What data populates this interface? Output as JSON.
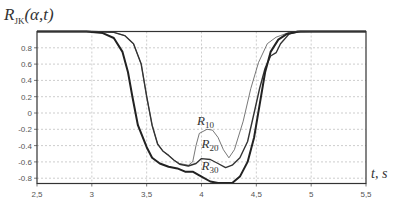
{
  "chart_data": {
    "type": "line",
    "title_main": "R",
    "title_sub": "JK",
    "title_args": "(α,t)",
    "xlabel": "t, s",
    "ylabel": "R_JK(α,t)",
    "xlim": [
      2.5,
      5.5
    ],
    "ylim": [
      -0.86,
      1.0
    ],
    "grid": true,
    "x_ticks": [
      2.5,
      3,
      3.5,
      4,
      4.5,
      5,
      5.5
    ],
    "x_tick_labels": [
      "2,5",
      "3",
      "3,5",
      "4",
      "4,5",
      "5",
      "5,5"
    ],
    "y_ticks": [
      0.8,
      0.6,
      0.4,
      0.2,
      0,
      -0.2,
      -0.4,
      -0.6,
      -0.8
    ],
    "y_tick_labels": [
      "0.8",
      "0.6",
      "0.4",
      "0.2",
      "0",
      "-0.2",
      "-0.4",
      "-0.6",
      "-0.8"
    ],
    "series": [
      {
        "name": "R10",
        "label_main": "R",
        "label_sub": "10",
        "label_pos": [
          3.96,
          -0.15
        ],
        "stroke_width": 0.8,
        "color": "#555555",
        "points": [
          [
            2.5,
            1.0
          ],
          [
            3.0,
            1.0
          ],
          [
            3.2,
            0.99
          ],
          [
            3.3,
            0.95
          ],
          [
            3.38,
            0.85
          ],
          [
            3.45,
            0.6
          ],
          [
            3.5,
            0.2
          ],
          [
            3.55,
            -0.15
          ],
          [
            3.6,
            -0.38
          ],
          [
            3.65,
            -0.47
          ],
          [
            3.7,
            -0.52
          ],
          [
            3.75,
            -0.58
          ],
          [
            3.8,
            -0.62
          ],
          [
            3.88,
            -0.64
          ],
          [
            3.92,
            -0.6
          ],
          [
            3.95,
            -0.4
          ],
          [
            3.98,
            -0.25
          ],
          [
            4.05,
            -0.2
          ],
          [
            4.1,
            -0.21
          ],
          [
            4.15,
            -0.3
          ],
          [
            4.2,
            -0.45
          ],
          [
            4.25,
            -0.55
          ],
          [
            4.3,
            -0.45
          ],
          [
            4.38,
            -0.1
          ],
          [
            4.45,
            0.3
          ],
          [
            4.52,
            0.62
          ],
          [
            4.6,
            0.85
          ],
          [
            4.68,
            0.93
          ],
          [
            4.72,
            0.95
          ],
          [
            4.8,
            0.99
          ],
          [
            5.0,
            1.0
          ],
          [
            5.5,
            1.0
          ]
        ]
      },
      {
        "name": "R20",
        "label_main": "R",
        "label_sub": "20",
        "label_pos": [
          4.0,
          -0.43
        ],
        "stroke_width": 1.4,
        "color": "#333333",
        "points": [
          [
            2.5,
            1.0
          ],
          [
            3.0,
            1.0
          ],
          [
            3.2,
            0.99
          ],
          [
            3.3,
            0.95
          ],
          [
            3.38,
            0.85
          ],
          [
            3.45,
            0.6
          ],
          [
            3.5,
            0.2
          ],
          [
            3.55,
            -0.15
          ],
          [
            3.6,
            -0.38
          ],
          [
            3.65,
            -0.47
          ],
          [
            3.7,
            -0.52
          ],
          [
            3.75,
            -0.58
          ],
          [
            3.8,
            -0.63
          ],
          [
            3.88,
            -0.65
          ],
          [
            3.95,
            -0.62
          ],
          [
            4.0,
            -0.56
          ],
          [
            4.08,
            -0.57
          ],
          [
            4.15,
            -0.62
          ],
          [
            4.22,
            -0.67
          ],
          [
            4.28,
            -0.64
          ],
          [
            4.35,
            -0.55
          ],
          [
            4.42,
            -0.35
          ],
          [
            4.48,
            0.0
          ],
          [
            4.53,
            0.3
          ],
          [
            4.58,
            0.55
          ],
          [
            4.63,
            0.7
          ],
          [
            4.68,
            0.74
          ],
          [
            4.72,
            0.85
          ],
          [
            4.8,
            0.97
          ],
          [
            4.9,
            1.0
          ],
          [
            5.5,
            1.0
          ]
        ]
      },
      {
        "name": "R30",
        "label_main": "R",
        "label_sub": "30",
        "label_pos": [
          4.0,
          -0.7
        ],
        "stroke_width": 2.0,
        "color": "#222222",
        "points": [
          [
            2.5,
            1.0
          ],
          [
            2.95,
            1.0
          ],
          [
            3.1,
            0.98
          ],
          [
            3.2,
            0.92
          ],
          [
            3.28,
            0.75
          ],
          [
            3.33,
            0.5
          ],
          [
            3.37,
            0.2
          ],
          [
            3.42,
            -0.15
          ],
          [
            3.5,
            -0.42
          ],
          [
            3.55,
            -0.55
          ],
          [
            3.62,
            -0.62
          ],
          [
            3.7,
            -0.66
          ],
          [
            3.78,
            -0.68
          ],
          [
            3.85,
            -0.72
          ],
          [
            3.92,
            -0.72
          ],
          [
            4.0,
            -0.78
          ],
          [
            4.08,
            -0.84
          ],
          [
            4.15,
            -0.86
          ],
          [
            4.28,
            -0.86
          ],
          [
            4.35,
            -0.78
          ],
          [
            4.42,
            -0.6
          ],
          [
            4.48,
            -0.3
          ],
          [
            4.53,
            0.1
          ],
          [
            4.58,
            0.5
          ],
          [
            4.63,
            0.75
          ],
          [
            4.7,
            0.9
          ],
          [
            4.78,
            0.97
          ],
          [
            4.88,
            1.0
          ],
          [
            5.5,
            1.0
          ]
        ]
      }
    ]
  }
}
